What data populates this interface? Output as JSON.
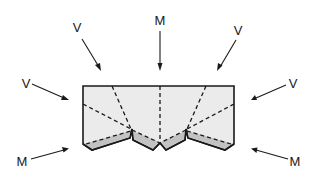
{
  "diagram": {
    "type": "origami fold diagram",
    "colors": {
      "paper": "#ebebeb",
      "flap_shade": "#c2c2c2",
      "line": "#1a1a1a"
    },
    "labels": [
      {
        "id": "top-left-v",
        "text": "V",
        "x": 77,
        "y": 32
      },
      {
        "id": "top-center-m",
        "text": "M",
        "x": 160,
        "y": 25
      },
      {
        "id": "top-right-v",
        "text": "V",
        "x": 238,
        "y": 35
      },
      {
        "id": "left-v",
        "text": "V",
        "x": 26,
        "y": 84
      },
      {
        "id": "right-v",
        "text": "V",
        "x": 293,
        "y": 84
      },
      {
        "id": "bottom-left-m",
        "text": "M",
        "x": 22,
        "y": 162
      },
      {
        "id": "bottom-right-m",
        "text": "M",
        "x": 295,
        "y": 162
      }
    ],
    "legend": {
      "V": "Valley fold",
      "M": "Mountain fold"
    }
  }
}
